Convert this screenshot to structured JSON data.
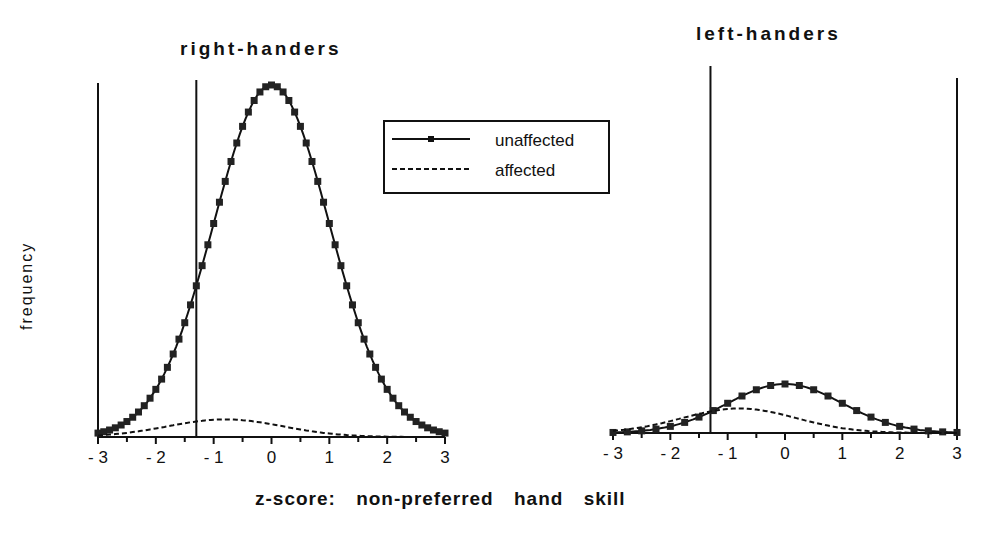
{
  "panels": {
    "right_handers": {
      "title": "right-handers"
    },
    "left_handers": {
      "title": "left-handers"
    }
  },
  "axes": {
    "ylabel": "frequency",
    "xlabel": "z-score:  non-preferred  hand  skill",
    "ticks": [
      "- 3",
      "- 2",
      "- 1",
      "0",
      "1",
      "2",
      "3"
    ]
  },
  "legend": {
    "items": [
      {
        "label": "unaffected",
        "style": "solid-with-square-markers"
      },
      {
        "label": "affected",
        "style": "dashed"
      }
    ]
  },
  "chart_data": [
    {
      "type": "line",
      "title": "right-handers",
      "xlabel": "z-score: non-preferred hand skill",
      "ylabel": "frequency",
      "xlim": [
        -3,
        3
      ],
      "x_ticks": [
        -3,
        -2,
        -1,
        0,
        1,
        2,
        3
      ],
      "grid": false,
      "legend_position": "upper right",
      "series": [
        {
          "name": "unaffected",
          "distribution": "normal",
          "mean": 0.0,
          "sd": 1.0,
          "relative_peak": 1.0,
          "markers": "square"
        },
        {
          "name": "affected",
          "distribution": "normal",
          "mean": -0.8,
          "sd": 1.0,
          "relative_peak": 0.05,
          "style": "dashed"
        }
      ],
      "vertical_lines": [
        -3.0,
        -1.3
      ]
    },
    {
      "type": "line",
      "title": "left-handers",
      "xlabel": "z-score: non-preferred hand skill",
      "ylabel": "frequency",
      "xlim": [
        -3,
        3
      ],
      "x_ticks": [
        -3,
        -2,
        -1,
        0,
        1,
        2,
        3
      ],
      "grid": false,
      "series": [
        {
          "name": "unaffected",
          "distribution": "normal",
          "mean": 0.0,
          "sd": 1.0,
          "relative_peak": 0.14,
          "markers": "square"
        },
        {
          "name": "affected",
          "distribution": "normal",
          "mean": -0.8,
          "sd": 1.0,
          "relative_peak": 0.07,
          "style": "dashed"
        }
      ],
      "vertical_lines": [
        -1.3,
        3.0
      ]
    }
  ]
}
